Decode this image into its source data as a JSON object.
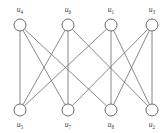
{
  "figure": {
    "type": "graph-diagram",
    "width": 164,
    "height": 133,
    "background_color": "#ffffff",
    "edge_color": "#6b6b6b",
    "node_stroke_color": "#5a5a5a",
    "node_fill_color": "#ffffff",
    "label_color": "#3a3a3a"
  },
  "nodes": [
    {
      "id": "n0",
      "label": "u",
      "subscript": "4",
      "full_label": "u4",
      "x": 20,
      "y": 25,
      "r": 6,
      "row": "top",
      "label_x": 20,
      "label_y": 12
    },
    {
      "id": "n1",
      "label": "u",
      "subscript": "6",
      "full_label": "u6",
      "x": 68,
      "y": 25,
      "r": 6,
      "row": "top",
      "label_x": 68,
      "label_y": 12
    },
    {
      "id": "n2",
      "label": "u",
      "subscript": "1",
      "full_label": "u1",
      "x": 111,
      "y": 25,
      "r": 6,
      "row": "top",
      "label_x": 111,
      "label_y": 12
    },
    {
      "id": "n3",
      "label": "u",
      "subscript": "3",
      "full_label": "u3",
      "x": 152,
      "y": 25,
      "r": 6,
      "row": "top",
      "label_x": 152,
      "label_y": 12
    },
    {
      "id": "n4",
      "label": "u",
      "subscript": "5",
      "full_label": "u5",
      "x": 20,
      "y": 110,
      "r": 6,
      "row": "bottom",
      "label_x": 20,
      "label_y": 127
    },
    {
      "id": "n5",
      "label": "u",
      "subscript": "7",
      "full_label": "u7",
      "x": 68,
      "y": 110,
      "r": 6,
      "row": "bottom",
      "label_x": 68,
      "label_y": 127
    },
    {
      "id": "n6",
      "label": "u",
      "subscript": "8",
      "full_label": "u8",
      "x": 111,
      "y": 110,
      "r": 6,
      "row": "bottom",
      "label_x": 111,
      "label_y": 127
    },
    {
      "id": "n7",
      "label": "u",
      "subscript": "2",
      "full_label": "u2",
      "x": 152,
      "y": 110,
      "r": 6,
      "row": "bottom",
      "label_x": 152,
      "label_y": 127
    }
  ],
  "edges": [
    {
      "id": "e0",
      "from": "n0",
      "to": "n4",
      "from_label": "u4",
      "to_label": "u5"
    },
    {
      "id": "e1",
      "from": "n0",
      "to": "n5",
      "from_label": "u4",
      "to_label": "u7"
    },
    {
      "id": "e2",
      "from": "n0",
      "to": "n6",
      "from_label": "u4",
      "to_label": "u8"
    },
    {
      "id": "e3",
      "from": "n1",
      "to": "n4",
      "from_label": "u6",
      "to_label": "u5"
    },
    {
      "id": "e4",
      "from": "n1",
      "to": "n5",
      "from_label": "u6",
      "to_label": "u7"
    },
    {
      "id": "e5",
      "from": "n1",
      "to": "n7",
      "from_label": "u6",
      "to_label": "u2"
    },
    {
      "id": "e6",
      "from": "n2",
      "to": "n4",
      "from_label": "u1",
      "to_label": "u5"
    },
    {
      "id": "e7",
      "from": "n2",
      "to": "n6",
      "from_label": "u1",
      "to_label": "u8"
    },
    {
      "id": "e8",
      "from": "n2",
      "to": "n7",
      "from_label": "u1",
      "to_label": "u2"
    },
    {
      "id": "e9",
      "from": "n3",
      "to": "n5",
      "from_label": "u3",
      "to_label": "u7"
    },
    {
      "id": "e10",
      "from": "n3",
      "to": "n6",
      "from_label": "u3",
      "to_label": "u8"
    },
    {
      "id": "e11",
      "from": "n3",
      "to": "n7",
      "from_label": "u3",
      "to_label": "u2"
    }
  ]
}
